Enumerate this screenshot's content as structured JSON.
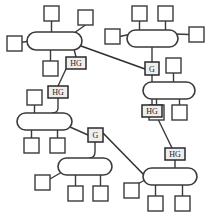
{
  "diagram": {
    "type": "node-link-diagram",
    "colors": {
      "stroke": "#3a3a3a",
      "node_fill": "#ffffff",
      "gateway_fill": "#eeeeee",
      "background": "#ffffff"
    },
    "labels": {
      "home_gateway": "HG",
      "gateway": "G"
    },
    "buses": [
      {
        "id": "bus-1",
        "name": "bus-top-left",
        "x": 27,
        "y": 32,
        "w": 55,
        "h": 18
      },
      {
        "id": "bus-2",
        "name": "bus-top-right",
        "x": 127,
        "y": 30,
        "w": 51,
        "h": 17
      },
      {
        "id": "bus-3",
        "name": "bus-middle-left",
        "x": 17,
        "y": 113,
        "w": 55,
        "h": 17
      },
      {
        "id": "bus-4",
        "name": "bus-middle-right",
        "x": 143,
        "y": 82,
        "w": 52,
        "h": 17
      },
      {
        "id": "bus-5",
        "name": "bus-bottom-left",
        "x": 58,
        "y": 158,
        "w": 54,
        "h": 17
      },
      {
        "id": "bus-6",
        "name": "bus-bottom-right",
        "x": 143,
        "y": 168,
        "w": 54,
        "h": 17
      }
    ],
    "nodes": [
      {
        "id": "n1",
        "name": "node-bus1-left",
        "x": 7,
        "y": 36,
        "s": 15
      },
      {
        "id": "n2",
        "name": "node-bus1-top-left",
        "x": 44,
        "y": 6,
        "s": 15
      },
      {
        "id": "n3",
        "name": "node-bus1-top-right",
        "x": 78,
        "y": 10,
        "s": 15
      },
      {
        "id": "n4",
        "name": "node-bus1-bottom",
        "x": 43,
        "y": 61,
        "s": 15
      },
      {
        "id": "n5",
        "name": "node-bus2-left",
        "x": 105,
        "y": 29,
        "s": 15
      },
      {
        "id": "n6",
        "name": "node-bus2-top-left",
        "x": 132,
        "y": 6,
        "s": 15
      },
      {
        "id": "n7",
        "name": "node-bus2-top-right",
        "x": 158,
        "y": 6,
        "s": 15
      },
      {
        "id": "n8",
        "name": "node-bus2-right",
        "x": 189,
        "y": 27,
        "s": 15
      },
      {
        "id": "n9",
        "name": "node-bus4-top",
        "x": 166,
        "y": 58,
        "s": 15
      },
      {
        "id": "n10",
        "name": "node-bus4-bottom-left",
        "x": 149,
        "y": 105,
        "s": 15
      },
      {
        "id": "n11",
        "name": "node-bus4-bottom-mid",
        "x": 172,
        "y": 105,
        "s": 15
      },
      {
        "id": "n12",
        "name": "node-bus3-top",
        "x": 27,
        "y": 90,
        "s": 15
      },
      {
        "id": "n13",
        "name": "node-bus3-bottom-left",
        "x": 24,
        "y": 138,
        "s": 15
      },
      {
        "id": "n14",
        "name": "node-bus3-bottom-mid",
        "x": 50,
        "y": 138,
        "s": 15
      },
      {
        "id": "n15",
        "name": "node-bus5-left",
        "x": 35,
        "y": 175,
        "s": 15
      },
      {
        "id": "n16",
        "name": "node-bus5-bottom-left",
        "x": 68,
        "y": 186,
        "s": 15
      },
      {
        "id": "n17",
        "name": "node-bus5-bottom-mid",
        "x": 93,
        "y": 186,
        "s": 15
      },
      {
        "id": "n18",
        "name": "node-bus6-left",
        "x": 124,
        "y": 183,
        "s": 15
      },
      {
        "id": "n19",
        "name": "node-bus6-bottom-left",
        "x": 148,
        "y": 196,
        "s": 15
      },
      {
        "id": "n20",
        "name": "node-bus6-bottom-mid",
        "x": 175,
        "y": 196,
        "s": 15
      }
    ],
    "gateways": [
      {
        "id": "hg1",
        "name": "home-gateway-1",
        "label": "HG",
        "x": 66,
        "y": 57,
        "w": 20,
        "h": 12
      },
      {
        "id": "hg2",
        "name": "home-gateway-2",
        "label": "HG",
        "x": 48,
        "y": 86,
        "w": 20,
        "h": 12
      },
      {
        "id": "g1",
        "name": "gateway-1",
        "label": "G",
        "x": 145,
        "y": 62,
        "w": 14,
        "h": 13
      },
      {
        "id": "hg3",
        "name": "home-gateway-3",
        "label": "HG",
        "x": 142,
        "y": 105,
        "w": 20,
        "h": 12
      },
      {
        "id": "g2",
        "name": "gateway-2",
        "label": "G",
        "x": 88,
        "y": 128,
        "w": 15,
        "h": 14
      },
      {
        "id": "hg4",
        "name": "home-gateway-4",
        "label": "HG",
        "x": 165,
        "y": 148,
        "w": 20,
        "h": 12
      }
    ],
    "edges": [
      {
        "name": "edge-bus1-n1",
        "d": "M 14.5 43.5 L 30 41"
      },
      {
        "name": "edge-bus1-n2",
        "d": "M 51.5 21 L 51.5 32"
      },
      {
        "name": "edge-bus1-n3",
        "d": "M 85.5 25 L 74 33"
      },
      {
        "name": "edge-bus1-n4",
        "d": "M 50.5 50 L 50.5 61"
      },
      {
        "name": "edge-bus1-hg1",
        "d": "M 74 49 L 76 57"
      },
      {
        "name": "edge-bus2-n5",
        "d": "M 120 36.5 L 131 34"
      },
      {
        "name": "edge-bus2-n6",
        "d": "M 139.5 21 L 139.5 30"
      },
      {
        "name": "edge-bus2-n7",
        "d": "M 165.5 21 L 165.5 30"
      },
      {
        "name": "edge-bus2-n8",
        "d": "M 189 34.5 L 175 34"
      },
      {
        "name": "edge-bus2-g1",
        "d": "M 152 47 L 152 62"
      },
      {
        "name": "edge-g1-bus4",
        "d": "M 152 75 L 152 82"
      },
      {
        "name": "edge-bus4-n9",
        "d": "M 173.5 73 L 173.5 82"
      },
      {
        "name": "edge-bus4-hg3",
        "d": "M 152 99 L 152 105"
      },
      {
        "name": "edge-bus4-n10",
        "d": "M 156.5 99 L 156.5 105"
      },
      {
        "name": "edge-bus4-n11",
        "d": "M 179.5 99 L 179.5 105"
      },
      {
        "name": "edge-hg1-hg2",
        "d": "M 66 69 L 58 86"
      },
      {
        "name": "edge-hg2-bus3",
        "d": "M 58 98 L 58 108 Q 58 113 52 113"
      },
      {
        "name": "edge-bus3-n12",
        "d": "M 34.5 105 L 34.5 113"
      },
      {
        "name": "edge-bus3-n13",
        "d": "M 31.5 130 L 31.5 138"
      },
      {
        "name": "edge-bus3-n14",
        "d": "M 57.5 130 L 57.5 138"
      },
      {
        "name": "edge-bus3-g2",
        "d": "M 70 127 L 88 135"
      },
      {
        "name": "edge-g2-bus5",
        "d": "M 95 142 L 95 152 Q 95 158 89 158"
      },
      {
        "name": "edge-bus5-n15",
        "d": "M 50 179 L 62 172"
      },
      {
        "name": "edge-bus5-n16",
        "d": "M 75.5 175 L 75.5 186"
      },
      {
        "name": "edge-bus5-n17",
        "d": "M 100.5 175 L 100.5 186"
      },
      {
        "name": "edge-hg3-hg4",
        "d": "M 157 117 L 172 148"
      },
      {
        "name": "edge-hg4-bus6",
        "d": "M 175 160 L 175 168"
      },
      {
        "name": "edge-bus6-n18",
        "d": "M 145 180 L 132 187"
      },
      {
        "name": "edge-bus6-n19",
        "d": "M 155.5 185 L 155.5 196"
      },
      {
        "name": "edge-bus6-n20",
        "d": "M 182.5 185 L 182.5 196"
      },
      {
        "name": "trunk-bus1-g1",
        "d": "M 81 46 L 145 69"
      },
      {
        "name": "trunk-g2-bus6",
        "d": "M 103 133 L 146 177"
      }
    ]
  }
}
